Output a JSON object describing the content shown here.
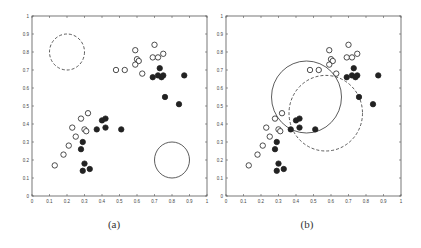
{
  "chart_data": [
    {
      "type": "scatter",
      "title": "",
      "caption": "(a)",
      "xlabel": "",
      "ylabel": "",
      "xlim": [
        0,
        1
      ],
      "ylim": [
        0,
        1
      ],
      "xticks": [
        "0",
        "0.1",
        "0.2",
        "0.3",
        "0.4",
        "0.5",
        "0.6",
        "0.7",
        "0.8",
        "0.9",
        "1"
      ],
      "yticks": [
        "0",
        "0.1",
        "0.2",
        "0.3",
        "0.4",
        "0.5",
        "0.6",
        "0.7",
        "0.8",
        "0.9",
        "1"
      ],
      "grid": false,
      "series": [
        {
          "name": "open",
          "marker": "open-circle",
          "points": [
            [
              0.13,
              0.17
            ],
            [
              0.18,
              0.23
            ],
            [
              0.21,
              0.28
            ],
            [
              0.25,
              0.33
            ],
            [
              0.23,
              0.38
            ],
            [
              0.28,
              0.43
            ],
            [
              0.32,
              0.46
            ],
            [
              0.3,
              0.37
            ],
            [
              0.31,
              0.36
            ],
            [
              0.48,
              0.7
            ],
            [
              0.53,
              0.7
            ],
            [
              0.59,
              0.81
            ],
            [
              0.6,
              0.76
            ],
            [
              0.61,
              0.75
            ],
            [
              0.59,
              0.73
            ],
            [
              0.63,
              0.68
            ],
            [
              0.7,
              0.84
            ],
            [
              0.69,
              0.77
            ],
            [
              0.72,
              0.77
            ],
            [
              0.75,
              0.79
            ]
          ]
        },
        {
          "name": "filled",
          "marker": "filled-circle",
          "points": [
            [
              0.28,
              0.26
            ],
            [
              0.29,
              0.3
            ],
            [
              0.29,
              0.14
            ],
            [
              0.3,
              0.18
            ],
            [
              0.33,
              0.15
            ],
            [
              0.37,
              0.37
            ],
            [
              0.4,
              0.42
            ],
            [
              0.42,
              0.43
            ],
            [
              0.42,
              0.38
            ],
            [
              0.51,
              0.37
            ],
            [
              0.69,
              0.66
            ],
            [
              0.72,
              0.67
            ],
            [
              0.73,
              0.71
            ],
            [
              0.74,
              0.66
            ],
            [
              0.75,
              0.67
            ],
            [
              0.76,
              0.55
            ],
            [
              0.84,
              0.51
            ],
            [
              0.87,
              0.67
            ]
          ]
        }
      ],
      "circles": [
        {
          "cx": 0.2,
          "cy": 0.8,
          "r": 0.1,
          "style": "dashed"
        },
        {
          "cx": 0.8,
          "cy": 0.2,
          "r": 0.1,
          "style": "solid"
        }
      ]
    },
    {
      "type": "scatter",
      "title": "",
      "caption": "(b)",
      "xlabel": "",
      "ylabel": "",
      "xlim": [
        0,
        1
      ],
      "ylim": [
        0,
        1
      ],
      "xticks": [
        "0",
        "0.1",
        "0.2",
        "0.3",
        "0.4",
        "0.5",
        "0.6",
        "0.7",
        "0.8",
        "0.9",
        "1"
      ],
      "yticks": [
        "0",
        "0.1",
        "0.2",
        "0.3",
        "0.4",
        "0.5",
        "0.6",
        "0.7",
        "0.8",
        "0.9",
        "1"
      ],
      "grid": false,
      "series": [
        {
          "name": "open",
          "marker": "open-circle",
          "points": [
            [
              0.13,
              0.17
            ],
            [
              0.18,
              0.23
            ],
            [
              0.21,
              0.28
            ],
            [
              0.25,
              0.33
            ],
            [
              0.23,
              0.38
            ],
            [
              0.28,
              0.43
            ],
            [
              0.32,
              0.46
            ],
            [
              0.3,
              0.37
            ],
            [
              0.31,
              0.36
            ],
            [
              0.48,
              0.7
            ],
            [
              0.53,
              0.7
            ],
            [
              0.59,
              0.81
            ],
            [
              0.6,
              0.76
            ],
            [
              0.61,
              0.75
            ],
            [
              0.59,
              0.73
            ],
            [
              0.63,
              0.68
            ],
            [
              0.7,
              0.84
            ],
            [
              0.69,
              0.77
            ],
            [
              0.72,
              0.77
            ],
            [
              0.75,
              0.79
            ]
          ]
        },
        {
          "name": "filled",
          "marker": "filled-circle",
          "points": [
            [
              0.28,
              0.26
            ],
            [
              0.29,
              0.3
            ],
            [
              0.29,
              0.14
            ],
            [
              0.3,
              0.18
            ],
            [
              0.33,
              0.15
            ],
            [
              0.37,
              0.37
            ],
            [
              0.4,
              0.42
            ],
            [
              0.42,
              0.43
            ],
            [
              0.42,
              0.38
            ],
            [
              0.51,
              0.37
            ],
            [
              0.69,
              0.66
            ],
            [
              0.72,
              0.67
            ],
            [
              0.73,
              0.71
            ],
            [
              0.74,
              0.66
            ],
            [
              0.75,
              0.67
            ],
            [
              0.76,
              0.55
            ],
            [
              0.84,
              0.51
            ],
            [
              0.87,
              0.67
            ]
          ]
        }
      ],
      "circles": [
        {
          "cx": 0.46,
          "cy": 0.55,
          "r": 0.2,
          "style": "solid"
        },
        {
          "cx": 0.57,
          "cy": 0.46,
          "r": 0.21,
          "style": "dashed"
        }
      ]
    }
  ],
  "panels": [
    {
      "caption": "(a)"
    },
    {
      "caption": "(b)"
    }
  ]
}
